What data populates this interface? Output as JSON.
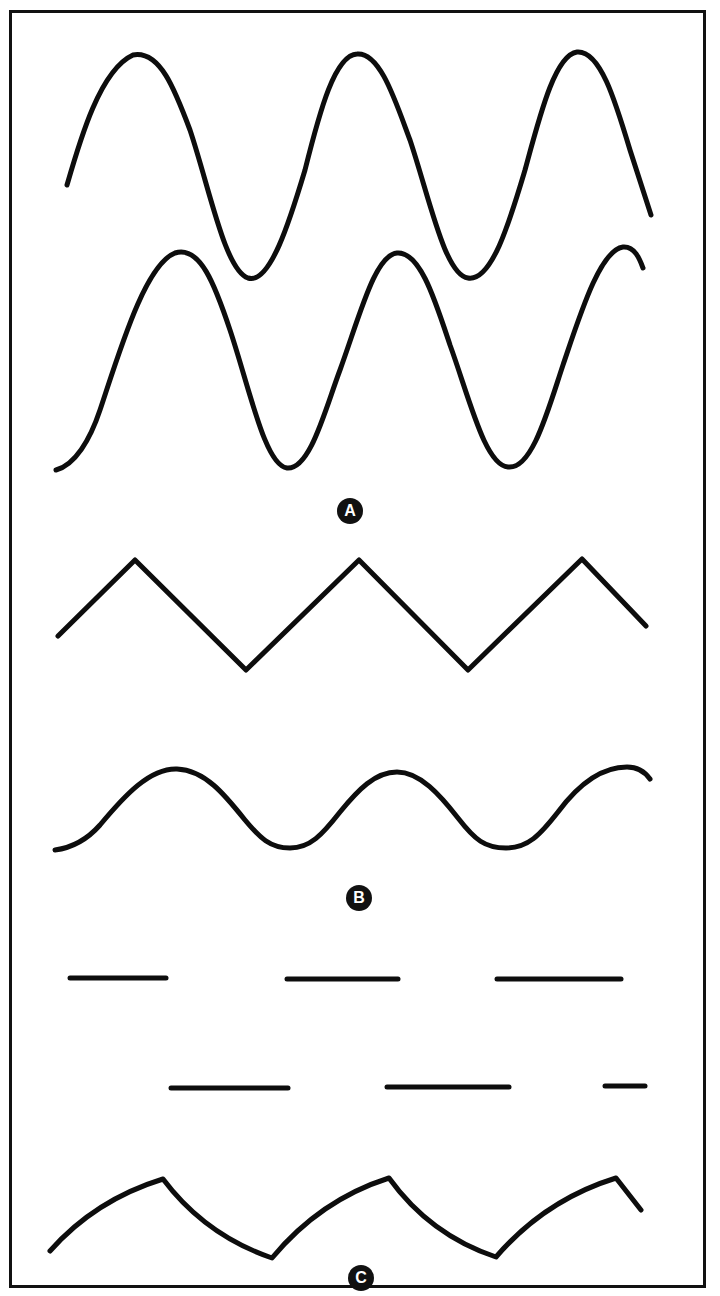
{
  "figure": {
    "colors": {
      "ink": "#0d0d0d",
      "background": "#ffffff",
      "badge_text": "#ffffff"
    },
    "panels": [
      {
        "label": "A",
        "description": "Two sine waves, phase-shifted",
        "waveforms": [
          {
            "name": "sine-wave-top",
            "type": "sine",
            "cycles": 2.75
          },
          {
            "name": "sine-wave-bottom",
            "type": "sine",
            "cycles": 2.75
          }
        ]
      },
      {
        "label": "B",
        "description": "Triangle wave above low-amplitude sine wave",
        "waveforms": [
          {
            "name": "triangle-wave",
            "type": "triangle",
            "cycles": 2.75
          },
          {
            "name": "low-amplitude-sine-wave",
            "type": "sine",
            "cycles": 2.75
          }
        ]
      },
      {
        "label": "C",
        "description": "Two rows of dashed pulses above a scalloped (half-wave/sawtooth-like) wave",
        "waveforms": [
          {
            "name": "pulse-row-top",
            "type": "dashes",
            "segments": 3
          },
          {
            "name": "pulse-row-bottom",
            "type": "dashes",
            "segments": 3
          },
          {
            "name": "scalloped-wave",
            "type": "scalloped",
            "cycles": 2.75
          }
        ]
      }
    ]
  }
}
